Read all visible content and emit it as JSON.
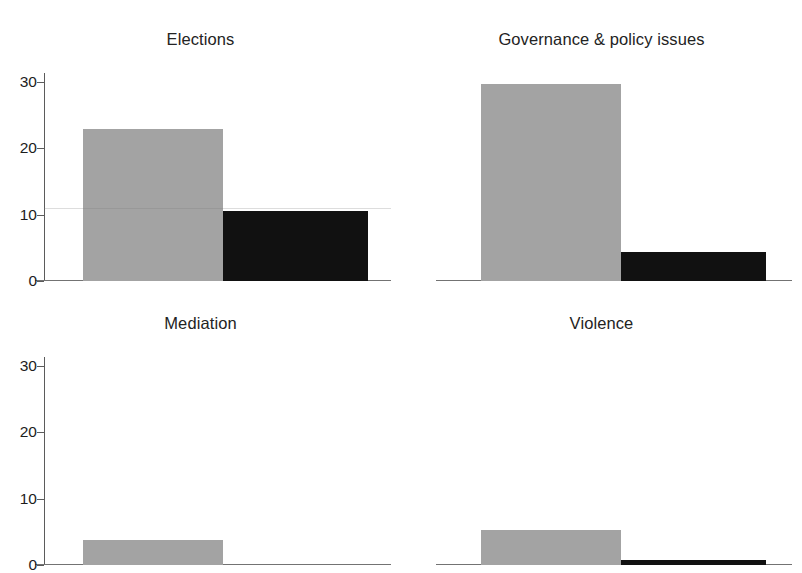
{
  "figure": {
    "title_cut_off": "",
    "background_color": "#ffffff",
    "gray_series_color": "#a3a3a3",
    "black_series_color": "#111111"
  },
  "chart_data": {
    "type": "bar",
    "title": "",
    "xlabel": "",
    "ylabel": "",
    "ylim": [
      0,
      32
    ],
    "yticks": [
      0,
      10,
      20,
      30
    ],
    "ytick_labels": [
      "0",
      "10",
      "20",
      "30"
    ],
    "grid": false,
    "legend_position": "none",
    "layout": "2x2 small multiples",
    "categories": [
      "Elections",
      "Governance & policy issues",
      "Mediation",
      "Violence"
    ],
    "series": [
      {
        "name": "gray",
        "color": "#a3a3a3",
        "values": [
          24,
          31,
          4,
          5.5
        ]
      },
      {
        "name": "black",
        "color": "#111111",
        "values": [
          11,
          4.5,
          0,
          0.8
        ]
      }
    ],
    "panels": [
      {
        "title": "Elections",
        "row": 0,
        "col": 0,
        "bars": [
          {
            "series": "gray",
            "value": 24,
            "color": "#a3a3a3"
          },
          {
            "series": "black",
            "value": 11,
            "color": "#111111"
          }
        ]
      },
      {
        "title": "Governance & policy issues",
        "row": 0,
        "col": 1,
        "bars": [
          {
            "series": "gray",
            "value": 31,
            "color": "#a3a3a3"
          },
          {
            "series": "black",
            "value": 4.5,
            "color": "#111111"
          }
        ]
      },
      {
        "title": "Mediation",
        "row": 1,
        "col": 0,
        "bars": [
          {
            "series": "gray",
            "value": 4,
            "color": "#a3a3a3"
          },
          {
            "series": "black",
            "value": 0,
            "color": "#111111"
          }
        ]
      },
      {
        "title": "Violence",
        "row": 1,
        "col": 1,
        "bars": [
          {
            "series": "gray",
            "value": 5.5,
            "color": "#a3a3a3"
          },
          {
            "series": "black",
            "value": 0.8,
            "color": "#111111"
          }
        ]
      }
    ]
  }
}
